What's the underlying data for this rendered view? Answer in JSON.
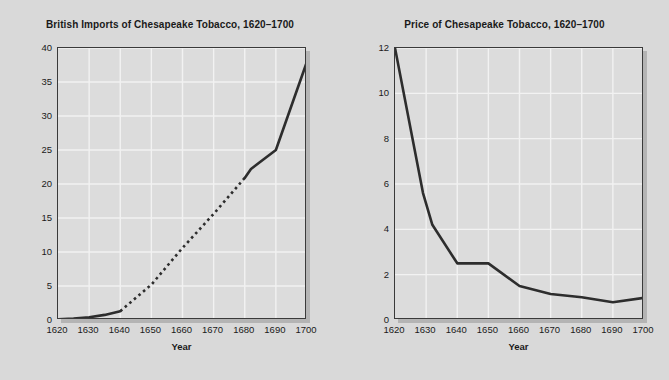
{
  "figure": {
    "background_color": "#d9d9d9",
    "plot_background_color": "#dcdcdc",
    "gridline_color": "#f2f2f2",
    "line_color": "#2d2d2d",
    "axis_color": "#3a3a3a"
  },
  "chart_data": [
    {
      "type": "line",
      "panel": "left",
      "title": "British Imports of Chesapeake Tobacco, 1620–1700",
      "xlabel": "Year",
      "ylabel": "Millions of Pounds",
      "xlim": [
        1620,
        1700
      ],
      "ylim": [
        0,
        40
      ],
      "xticks": [
        1620,
        1630,
        1640,
        1650,
        1660,
        1670,
        1680,
        1690,
        1700
      ],
      "yticks": [
        0,
        5,
        10,
        15,
        20,
        25,
        30,
        35,
        40
      ],
      "grid": true,
      "legend": null,
      "series": [
        {
          "name": "Imports (documented)",
          "style": "solid",
          "x": [
            1620,
            1625,
            1630,
            1635,
            1640
          ],
          "values": [
            0.12,
            0.2,
            0.4,
            0.75,
            1.3
          ]
        },
        {
          "name": "Imports (estimated)",
          "style": "dashed",
          "x": [
            1640,
            1650,
            1660,
            1670,
            1680
          ],
          "values": [
            1.3,
            5.2,
            10.6,
            15.6,
            20.9
          ]
        },
        {
          "name": "Imports (documented, late)",
          "style": "solid",
          "x": [
            1680,
            1682,
            1690,
            1700
          ],
          "values": [
            20.9,
            22.2,
            25.0,
            38.0
          ]
        }
      ]
    },
    {
      "type": "line",
      "panel": "right",
      "title": "Price of Chesapeake Tobacco, 1620–1700",
      "xlabel": "Year",
      "ylabel": "Pence Sterling per Pound",
      "xlim": [
        1620,
        1700
      ],
      "ylim": [
        0,
        12
      ],
      "xticks": [
        1620,
        1630,
        1640,
        1650,
        1660,
        1670,
        1680,
        1690,
        1700
      ],
      "yticks": [
        0,
        2,
        4,
        6,
        8,
        10,
        12
      ],
      "grid": true,
      "legend": null,
      "series": [
        {
          "name": "Price",
          "style": "solid",
          "x": [
            1620,
            1629,
            1632,
            1640,
            1650,
            1660,
            1670,
            1680,
            1690,
            1700
          ],
          "values": [
            12.0,
            5.6,
            4.2,
            2.5,
            2.5,
            1.5,
            1.15,
            1.0,
            0.78,
            0.98
          ]
        }
      ]
    }
  ]
}
